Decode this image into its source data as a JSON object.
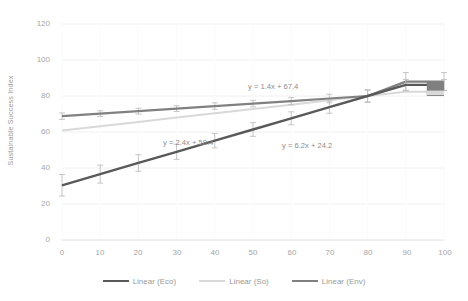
{
  "chart_data": {
    "type": "line",
    "title": "",
    "xlabel": "",
    "ylabel": "Sustainable Success Index",
    "xlim": [
      0,
      100
    ],
    "ylim": [
      0,
      120
    ],
    "xticks": [
      "0",
      "10",
      "20",
      "30",
      "40",
      "50",
      "60",
      "70",
      "80",
      "90",
      "100"
    ],
    "yticks": [
      "0",
      "20",
      "40",
      "60",
      "80",
      "100",
      "120"
    ],
    "grid": "horizontal",
    "legend_position": "bottom-center",
    "x": [
      0,
      10,
      20,
      30,
      40,
      50,
      60,
      70,
      80,
      90,
      100
    ],
    "series": [
      {
        "name": "Linear (Eco)",
        "color": "#595959",
        "equation": "y = 6.2x + 24.2",
        "values": [
          30.4,
          36.6,
          42.8,
          49.0,
          55.2,
          61.4,
          67.6,
          73.8,
          80.0,
          86.2,
          86.2
        ],
        "errors": [
          6.0,
          5.0,
          4.6,
          4.2,
          4.0,
          3.8,
          3.6,
          3.4,
          3.2,
          3.0,
          3.0
        ]
      },
      {
        "name": "Linear (So)",
        "color": "#d9d9d9",
        "equation": "y = 2.4x + 58.4",
        "values": [
          60.8,
          63.2,
          65.6,
          68.0,
          70.4,
          72.8,
          75.2,
          77.6,
          80.0,
          82.4,
          82.4
        ],
        "errors": [
          0,
          0,
          0,
          0,
          0,
          0,
          0,
          0,
          0,
          0,
          0
        ]
      },
      {
        "name": "Linear (Env)",
        "color": "#808080",
        "equation": "y = 1.4x + 67.4",
        "values": [
          68.8,
          70.2,
          71.6,
          73.0,
          74.4,
          75.8,
          77.2,
          78.6,
          80.0,
          88.0,
          88.0
        ],
        "errors": [
          1.8,
          1.6,
          1.6,
          1.6,
          1.8,
          1.8,
          2.0,
          2.4,
          3.6,
          5.0,
          5.0
        ]
      }
    ],
    "annotations": [
      {
        "text": "y = 1.4x + 67.4",
        "x": 63,
        "y": 86,
        "color": "#8c8c8c"
      },
      {
        "text": "y = 2.4x + 58.4",
        "x": 27,
        "y": 50,
        "color": "#8c8c8c"
      },
      {
        "text": "y = 6.2x + 24.2",
        "x": 62,
        "y": 45,
        "color": "#8c8c8c"
      }
    ]
  },
  "axis": {
    "y_title": "Sustainable Success Index",
    "y_ticks": [
      "120",
      "100",
      "80",
      "60",
      "40",
      "20",
      "0"
    ],
    "x_ticks": [
      "0",
      "10",
      "20",
      "30",
      "40",
      "50",
      "60",
      "70",
      "80",
      "90",
      "100"
    ]
  },
  "equations": {
    "env": "y = 1.4x + 67.4",
    "so": "y = 2.4x + 58.4",
    "eco": "y = 6.2x + 24.2"
  },
  "legend": {
    "items": [
      {
        "label": "Linear (Eco)",
        "color": "#595959"
      },
      {
        "label": "Linear (So)",
        "color": "#d9d9d9"
      },
      {
        "label": "Linear (Env)",
        "color": "#808080"
      }
    ]
  },
  "colors": {
    "eco": "#595959",
    "so": "#d9d9d9",
    "env": "#808080",
    "grid": "#f0f0f0",
    "tick_text": "#a6a6a6",
    "title_text": "#9b9b9b",
    "annotation_text": "#8c8c8c",
    "background": "#ffffff"
  }
}
